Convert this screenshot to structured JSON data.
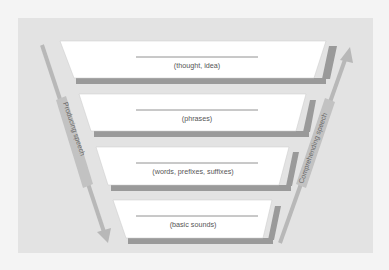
{
  "diagram": {
    "type": "funnel-levels",
    "levels": [
      {
        "label": "(thought, idea)"
      },
      {
        "label": "(phrases)"
      },
      {
        "label": "(words, prefixes, suffixes)"
      },
      {
        "label": "(basic sounds)"
      }
    ],
    "left_arrow": {
      "label": "Producing speech",
      "direction": "down"
    },
    "right_arrow": {
      "label": "Comprehending speech",
      "direction": "up"
    },
    "colors": {
      "background": "#e3e3e3",
      "panel": "#ffffff",
      "panel_shadow": "#9a9a9a",
      "arrow": "#b3b3b3",
      "arrow_label_box": "#c4c4c4",
      "text": "#555555"
    }
  }
}
